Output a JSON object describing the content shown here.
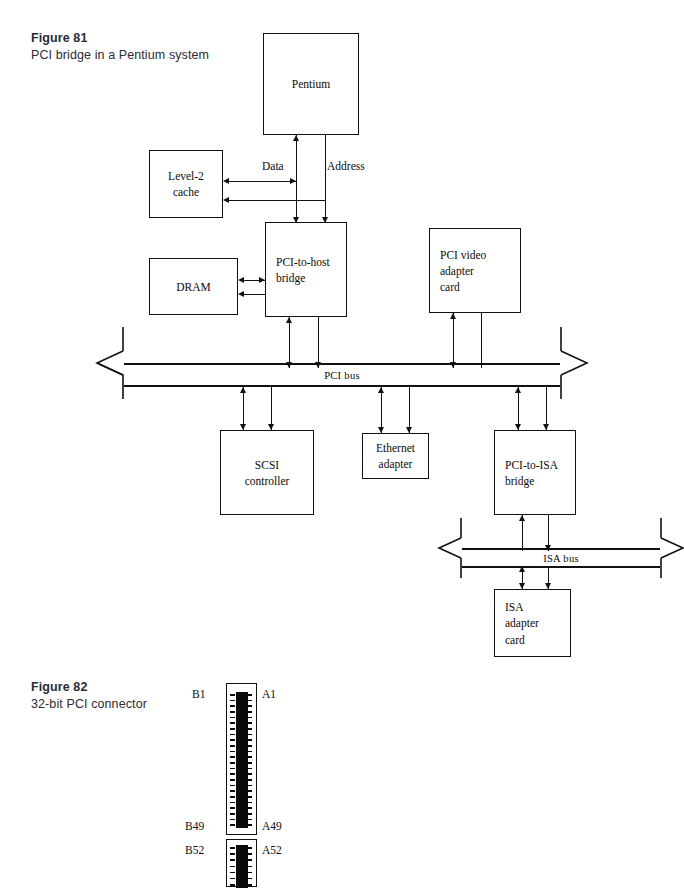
{
  "page": {
    "width": 683,
    "height": 887,
    "background": "#ffffff",
    "ink": "#111111",
    "caption_color": "#2b2b33"
  },
  "figure81": {
    "caption_title": "Figure 81",
    "caption_subtitle": "PCI bridge in a Pentium\nsystem",
    "boxes": {
      "pentium": "Pentium",
      "level2_cache": "Level-2\ncache",
      "pci_to_host_bridge": "PCI-to-host\nbridge",
      "dram": "DRAM",
      "pci_video_adapter_card": "PCI video\nadapter\ncard",
      "scsi_controller": "SCSI\ncontroller",
      "ethernet_adapter": "Ethernet\nadapter",
      "pci_to_isa_bridge": "PCI-to-ISA\nbridge",
      "isa_adapter_card": "ISA\nadapter\ncard"
    },
    "signal_labels": {
      "data": "Data",
      "address": "Address"
    },
    "buses": {
      "pci_bus": "PCI  bus",
      "isa_bus": "ISA bus"
    }
  },
  "figure82": {
    "caption_title": "Figure 82",
    "caption_subtitle": "32-bit PCI connector",
    "pin_labels": {
      "b_top": "B1",
      "a_top": "A1",
      "b_mid": "B49",
      "a_mid": "A49",
      "b_bottom": "B52",
      "a_bottom": "A52"
    }
  }
}
